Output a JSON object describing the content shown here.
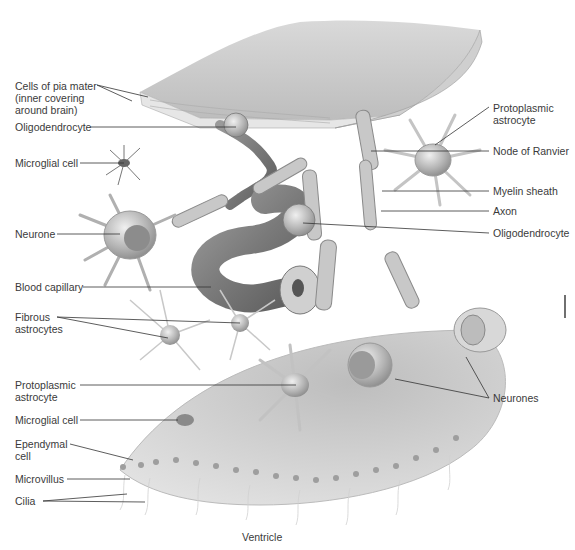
{
  "figure": {
    "bottom_caption": "Ventricle",
    "labels_left": [
      {
        "id": "pia",
        "text": "Cells of pia mater\n(inner covering\naround brain)"
      },
      {
        "id": "oligo1",
        "text": "Oligodendrocyte"
      },
      {
        "id": "microglia1",
        "text": "Microglial cell"
      },
      {
        "id": "neurone",
        "text": "Neurone"
      },
      {
        "id": "capillary",
        "text": "Blood capillary"
      },
      {
        "id": "fibrous",
        "text": "Fibrous\nastrocytes"
      },
      {
        "id": "proto2",
        "text": "Protoplasmic\nastrocyte"
      },
      {
        "id": "microglia2",
        "text": "Microglial cell"
      },
      {
        "id": "ependymal",
        "text": "Ependymal\ncell"
      },
      {
        "id": "microvillus",
        "text": "Microvillus"
      },
      {
        "id": "cilia",
        "text": "Cilia"
      }
    ],
    "labels_right": [
      {
        "id": "proto1",
        "text": "Protoplasmic\nastrocyte"
      },
      {
        "id": "ranvier",
        "text": "Node of Ranvier"
      },
      {
        "id": "myelin",
        "text": "Myelin sheath"
      },
      {
        "id": "axon",
        "text": "Axon"
      },
      {
        "id": "oligo2",
        "text": "Oligodendrocyte"
      },
      {
        "id": "neurones",
        "text": "Neurones"
      }
    ]
  }
}
